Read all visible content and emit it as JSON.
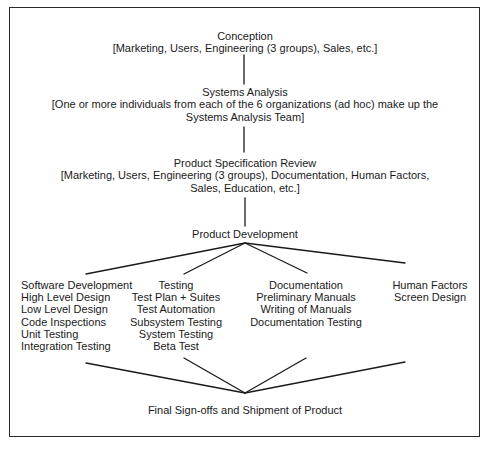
{
  "diagram": {
    "type": "flow",
    "stages": {
      "conception": {
        "title": "Conception",
        "detail": "[Marketing, Users, Engineering (3 groups), Sales, etc.]"
      },
      "systems_analysis": {
        "title": "Systems Analysis",
        "detail_line1": "[One or more individuals from each of the 6 organizations (ad hoc) make up the",
        "detail_line2": "Systems Analysis Team]"
      },
      "spec_review": {
        "title": "Product Specification Review",
        "detail_line1": "[Marketing, Users, Engineering (3 groups), Documentation, Human Factors,",
        "detail_line2": "Sales, Education, etc.]"
      },
      "product_development": {
        "title": "Product Development"
      },
      "final": {
        "title": "Final Sign-offs and Shipment of Product"
      }
    },
    "branches": [
      {
        "title": "Software Development",
        "items": [
          "High Level Design",
          "Low Level Design",
          "Code Inspections",
          "Unit Testing",
          "Integration Testing"
        ]
      },
      {
        "title": "Testing",
        "items": [
          "Test Plan + Suites",
          "Test Automation",
          "Subsystem Testing",
          "System Testing",
          "Beta Test"
        ]
      },
      {
        "title": "Documentation",
        "items": [
          "Preliminary Manuals",
          "Writing of Manuals",
          "Documentation Testing"
        ]
      },
      {
        "title": "Human Factors",
        "items": [
          "Screen Design"
        ]
      }
    ],
    "colors": {
      "line": "#1a1a1a",
      "text": "#1a1a1a",
      "background": "#ffffff"
    }
  }
}
